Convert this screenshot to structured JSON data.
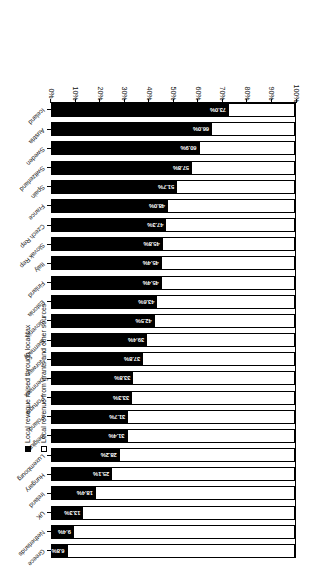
{
  "chart_data": {
    "type": "bar",
    "subtype": "stacked-horizontal-100-percent",
    "title": "",
    "xlabel": "",
    "ylabel": "",
    "orientation": "rotated-180",
    "grid": false,
    "xlim": [
      0,
      100
    ],
    "axis_reversed": true,
    "tick_labels": [
      "100%",
      "90%",
      "80%",
      "70%",
      "60%",
      "50%",
      "40%",
      "30%",
      "20%",
      "10%",
      "0%"
    ],
    "tick_values": [
      100,
      90,
      80,
      70,
      60,
      50,
      40,
      30,
      20,
      10,
      0
    ],
    "legend_position": "right",
    "legend": [
      {
        "key": "grants",
        "label": "Local revenue from grants and other sources",
        "swatch": "white"
      },
      {
        "key": "tax",
        "label": "Local revenue raised through local tax",
        "swatch": "black"
      }
    ],
    "categories": [
      "Greece",
      "Netherlands",
      "UK",
      "Ireland",
      "Hungary",
      "Luxembourg",
      "Belgium",
      "Poland",
      "Portugal",
      "Denmark",
      "Norway",
      "Germany",
      "Slovenia",
      "Estonia",
      "Finland",
      "Italy",
      "Slovak Rep",
      "Czech Rep",
      "France",
      "Spain",
      "Switzerland",
      "Sweden",
      "Austria",
      "Iceland"
    ],
    "series": [
      {
        "name": "Local revenue raised through local tax",
        "color": "#000000",
        "values": [
          6.8,
          9.4,
          13.3,
          18.4,
          25.1,
          28.2,
          31.4,
          31.7,
          33.3,
          33.8,
          37.8,
          39.4,
          42.5,
          43.6,
          45.4,
          45.4,
          45.8,
          47.3,
          48.0,
          51.7,
          57.8,
          60.9,
          66.0,
          73.0
        ],
        "labels": [
          "6.8%",
          "9.4%",
          "13.3%",
          "18.4%",
          "25.1%",
          "28.2%",
          "31.4%",
          "31.7%",
          "33.3%",
          "33.8%",
          "37.8%",
          "39.4%",
          "42.5%",
          "43.6%",
          "45.4%",
          "45.4%",
          "45.8%",
          "47.3%",
          "48.0%",
          "51.7%",
          "57.8%",
          "60.9%",
          "66.0%",
          "73.0%"
        ]
      },
      {
        "name": "Local revenue from grants and other sources",
        "color": "#ffffff",
        "values": [
          93.2,
          90.6,
          86.7,
          81.6,
          74.9,
          71.8,
          68.6,
          68.3,
          66.7,
          66.2,
          62.2,
          60.6,
          57.5,
          56.4,
          54.6,
          54.6,
          54.2,
          52.7,
          52.0,
          48.3,
          42.2,
          39.1,
          34.0,
          27.0
        ]
      }
    ]
  },
  "colors": {
    "tax": "#000000",
    "grants": "#ffffff",
    "axis": "#000000",
    "text": "#111111",
    "background": "#ffffff"
  }
}
